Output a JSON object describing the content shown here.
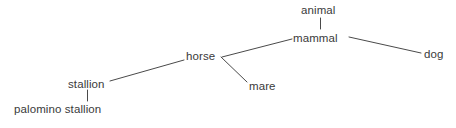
{
  "diagram": {
    "type": "hierarchy-tree",
    "title": "",
    "background_color": "#ffffff",
    "text_color": "#3a3a3a",
    "edge_color": "#4a4a4a",
    "nodes": [
      {
        "id": "animal",
        "label": "animal",
        "x": 301,
        "y": 4,
        "w": 45
      },
      {
        "id": "mammal",
        "label": "mammal",
        "x": 293,
        "y": 32,
        "w": 53
      },
      {
        "id": "dog",
        "label": "dog",
        "x": 424,
        "y": 48,
        "w": 20
      },
      {
        "id": "horse",
        "label": "horse",
        "x": 186,
        "y": 50,
        "w": 34
      },
      {
        "id": "mare",
        "label": "mare",
        "x": 249,
        "y": 80,
        "w": 28
      },
      {
        "id": "stallion",
        "label": "stallion",
        "x": 68,
        "y": 78,
        "w": 40
      },
      {
        "id": "palomino_stallion",
        "label": "palomino stallion",
        "x": 14,
        "y": 103,
        "w": 95
      }
    ],
    "edges": [
      {
        "id": "animal-mammal",
        "from": "animal",
        "to": "mammal",
        "x1": 320,
        "y1": 18,
        "x2": 320,
        "y2": 29
      },
      {
        "id": "mammal-dog",
        "from": "mammal",
        "to": "dog",
        "x1": 349,
        "y1": 37,
        "x2": 421,
        "y2": 53
      },
      {
        "id": "mammal-horse",
        "from": "mammal",
        "to": "horse",
        "x1": 292,
        "y1": 39,
        "x2": 222,
        "y2": 57
      },
      {
        "id": "horse-mare",
        "from": "horse",
        "to": "mare",
        "x1": 221,
        "y1": 57,
        "x2": 247,
        "y2": 82
      },
      {
        "id": "horse-stallion",
        "from": "horse",
        "to": "stallion",
        "x1": 184,
        "y1": 60,
        "x2": 110,
        "y2": 81
      },
      {
        "id": "stallion-palomino",
        "from": "stallion",
        "to": "palomino_stallion",
        "x1": 87,
        "y1": 90,
        "x2": 87,
        "y2": 101
      }
    ]
  }
}
